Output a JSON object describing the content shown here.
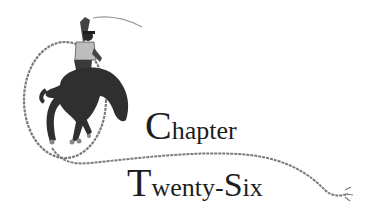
{
  "heading": {
    "line1": {
      "initial": "C",
      "rest": "hapter"
    },
    "line2": {
      "initial": "T",
      "rest": "wenty-",
      "initial2": "S",
      "rest2": "ix"
    }
  },
  "illustration": {
    "subject": "rodeo-rider-on-bucking-horse-with-lasso",
    "colors": {
      "ink": "#1e1e1e",
      "rope": "#7a7a7a",
      "horse": "#2f2f2f",
      "shirt": "#bdbdbd"
    }
  }
}
